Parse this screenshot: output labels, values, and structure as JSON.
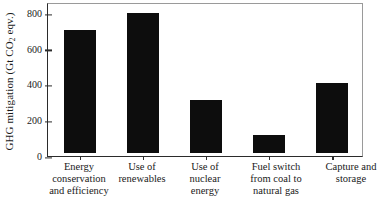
{
  "chart_data": {
    "type": "bar",
    "title": "",
    "xlabel": "",
    "ylabel": "GHG mitigation (Gt CO2 eqv.)",
    "ylabel_prefix": "GHG mitigation (Gt CO",
    "ylabel_sub": "2",
    "ylabel_suffix": " eqv.)",
    "categories": [
      "Energy conservation and efficiency",
      "Use of renewables",
      "Use of nuclear energy",
      "Fuel switch from coal to natural gas",
      "Capture and storage"
    ],
    "category_lines": [
      [
        "Energy",
        "conservation",
        "and efficiency"
      ],
      [
        "Use of",
        "renewables"
      ],
      [
        "Use of",
        "nuclear",
        "energy"
      ],
      [
        "Fuel switch",
        "from coal to",
        "natural gas"
      ],
      [
        "Capture and",
        "storage"
      ]
    ],
    "values": [
      700,
      800,
      300,
      100,
      400
    ],
    "ylim": [
      0,
      800
    ],
    "yticks": [
      0,
      200,
      400,
      600,
      800
    ],
    "ytick_labels": [
      "0",
      "200",
      "400",
      "600",
      "800"
    ],
    "grid": false,
    "legend": false,
    "bar_color": "#0d0d0d",
    "axis_color": "#2b2b2b",
    "background": "#ffffff"
  }
}
